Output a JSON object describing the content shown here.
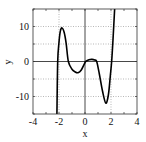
{
  "chart_data": {
    "type": "line",
    "title": "",
    "xlabel": "x",
    "ylabel": "y",
    "xlim": [
      -4,
      4
    ],
    "ylim": [
      -15,
      15
    ],
    "xticks": [
      -4,
      -2,
      0,
      2,
      4
    ],
    "yticks": [
      -10,
      0,
      10
    ],
    "grid": true,
    "grid_x": [
      -2,
      2
    ],
    "grid_y": [
      -10,
      -5,
      5,
      10
    ],
    "series": [
      {
        "name": "y",
        "color": "#000000",
        "x": [
          -2.16,
          -2.1,
          -2.0,
          -1.9,
          -1.77,
          -1.6,
          -1.45,
          -1.28,
          -1.0,
          -0.75,
          -0.54,
          -0.3,
          0.0,
          0.05,
          0.3,
          0.54,
          0.75,
          0.9,
          1.1,
          1.35,
          1.6,
          1.8,
          1.95,
          2.05,
          2.15,
          2.28
        ],
        "y": [
          -15,
          0.0,
          5.5,
          8.6,
          9.6,
          8.3,
          5.2,
          0.0,
          -2.2,
          -3.0,
          -3.2,
          -2.5,
          -0.3,
          0.0,
          0.5,
          0.6,
          0.4,
          0.0,
          -3.5,
          -8.5,
          -11.9,
          -9.5,
          -4.0,
          0.0,
          6.0,
          15
        ]
      }
    ]
  }
}
